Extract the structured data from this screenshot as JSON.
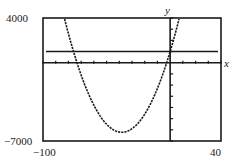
{
  "chart_data": {
    "type": "line",
    "title": "",
    "xlabel": "x",
    "ylabel": "y",
    "xlim": [
      -100,
      40
    ],
    "ylim": [
      -7000,
      4000
    ],
    "xscale_ticks": 10,
    "yscale_ticks": 1000,
    "grid": false,
    "legend": null,
    "window_labels": {
      "ymax": "4000",
      "ymin": "−7000",
      "xmin": "−100",
      "xmax": "40"
    },
    "series": [
      {
        "name": "parabola",
        "equation": "y = 5x^2 + 380x + 1000",
        "style": "dotted",
        "approx_roots": [
          -73,
          -3
        ],
        "approx_vertex": [
          -38,
          -6220
        ]
      },
      {
        "name": "horizontal line",
        "equation": "y = 1000",
        "style": "solid"
      }
    ]
  },
  "labels": {
    "ymax": "4000",
    "ymin": "−7000",
    "xmin": "−100",
    "xmax": "40",
    "x_axis": "x",
    "y_axis": "y"
  }
}
